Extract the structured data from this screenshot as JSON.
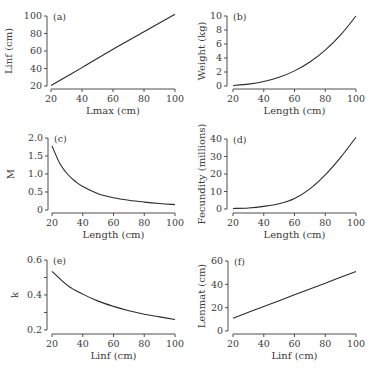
{
  "chart_data": [
    {
      "panel": "(a)",
      "type": "line",
      "xlabel": "Lmax (cm)",
      "ylabel": "Linf (cm)",
      "xlim": [
        20,
        100
      ],
      "ylim": [
        20,
        100
      ],
      "xticks": [
        20,
        40,
        60,
        80,
        100
      ],
      "yticks": [
        20,
        40,
        60,
        80,
        100
      ],
      "grid": false,
      "x": [
        20,
        40,
        60,
        80,
        100
      ],
      "y": [
        20.5,
        41,
        62,
        82,
        102
      ]
    },
    {
      "panel": "(b)",
      "type": "line",
      "xlabel": "Length (cm)",
      "ylabel": "Weight (kg)",
      "xlim": [
        20,
        100
      ],
      "ylim": [
        0,
        10
      ],
      "xticks": [
        20,
        40,
        60,
        80,
        100
      ],
      "yticks": [
        0,
        2,
        4,
        6,
        8,
        10
      ],
      "grid": false,
      "x": [
        20,
        30,
        40,
        50,
        60,
        70,
        80,
        90,
        100
      ],
      "y": [
        0.08,
        0.27,
        0.64,
        1.25,
        2.16,
        3.43,
        5.12,
        7.29,
        10.0
      ]
    },
    {
      "panel": "(c)",
      "type": "line",
      "xlabel": "Length (cm)",
      "ylabel": "M",
      "xlim": [
        20,
        100
      ],
      "ylim": [
        0,
        2.0
      ],
      "xticks": [
        20,
        40,
        60,
        80,
        100
      ],
      "yticks": [
        0,
        0.5,
        1.0,
        1.5,
        2.0
      ],
      "ytick_labels": [
        "0",
        "0.5",
        "1.0",
        "1.5",
        "2.0"
      ],
      "grid": false,
      "x": [
        20,
        25,
        30,
        35,
        40,
        50,
        60,
        70,
        80,
        90,
        100
      ],
      "y": [
        1.78,
        1.3,
        1.0,
        0.8,
        0.65,
        0.45,
        0.34,
        0.27,
        0.22,
        0.18,
        0.15
      ]
    },
    {
      "panel": "(d)",
      "type": "line",
      "xlabel": "Length (cm)",
      "ylabel": "Fecundity (millions)",
      "xlim": [
        20,
        100
      ],
      "ylim": [
        0,
        40
      ],
      "xticks": [
        20,
        40,
        60,
        80,
        100
      ],
      "yticks": [
        0,
        10,
        20,
        30,
        40
      ],
      "grid": false,
      "x": [
        20,
        30,
        40,
        50,
        60,
        70,
        80,
        90,
        100
      ],
      "y": [
        0.3,
        0.6,
        1.5,
        3.0,
        6.0,
        11.5,
        19.5,
        29.5,
        41.0
      ]
    },
    {
      "panel": "(e)",
      "type": "line",
      "xlabel": "Linf (cm)",
      "ylabel": "k",
      "xlim": [
        20,
        100
      ],
      "ylim": [
        0.2,
        0.6
      ],
      "xticks": [
        20,
        40,
        60,
        80,
        100
      ],
      "yticks": [
        0.2,
        0.3,
        0.4,
        0.5,
        0.6
      ],
      "ytick_labels": [
        "0.2",
        "",
        "0.4",
        "",
        "0.6"
      ],
      "grid": false,
      "x": [
        20,
        30,
        40,
        50,
        60,
        70,
        80,
        90,
        100
      ],
      "y": [
        0.535,
        0.455,
        0.405,
        0.365,
        0.335,
        0.31,
        0.29,
        0.275,
        0.26
      ]
    },
    {
      "panel": "(f)",
      "type": "line",
      "xlabel": "Linf (cm)",
      "ylabel": "Lenmat (cm)",
      "xlim": [
        20,
        100
      ],
      "ylim": [
        0,
        60
      ],
      "xticks": [
        20,
        40,
        60,
        80,
        100
      ],
      "yticks": [
        0,
        20,
        40,
        60
      ],
      "grid": false,
      "x": [
        20,
        40,
        60,
        80,
        100
      ],
      "y": [
        11,
        21,
        31,
        41,
        51
      ]
    }
  ],
  "layout": {
    "panels": [
      {
        "yaxis_x": 47,
        "x0": 51,
        "x1": 175,
        "ytop": 16,
        "ybot": 86,
        "xaxis_y": 89,
        "label_x": 8
      },
      {
        "yaxis_x": 227,
        "x0": 233,
        "x1": 356,
        "ytop": 16,
        "ybot": 86,
        "xaxis_y": 89,
        "label_x": 201
      },
      {
        "yaxis_x": 48,
        "x0": 52,
        "x1": 175,
        "ytop": 138,
        "ybot": 210,
        "xaxis_y": 213,
        "label_x": 10
      },
      {
        "yaxis_x": 227,
        "x0": 233,
        "x1": 356,
        "ytop": 139,
        "ybot": 209,
        "xaxis_y": 213,
        "label_x": 201
      },
      {
        "yaxis_x": 47,
        "x0": 52,
        "x1": 175,
        "ytop": 260,
        "ybot": 330,
        "xaxis_y": 334,
        "label_x": 14
      },
      {
        "yaxis_x": 228,
        "x0": 233,
        "x1": 356,
        "ytop": 261,
        "ybot": 331,
        "xaxis_y": 334,
        "label_x": 201
      }
    ],
    "line_color": "#2a2a2a",
    "axis_color": "#3a3a3a"
  }
}
